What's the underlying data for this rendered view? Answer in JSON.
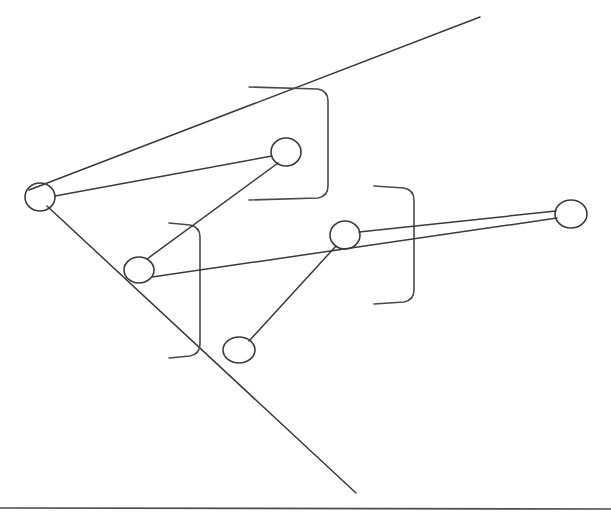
{
  "canvas": {
    "width": 611,
    "height": 517,
    "background": "#ffffff",
    "ink_color": "#3a3a3a"
  },
  "diagram": {
    "style": "pen line drawing",
    "nodes": [
      {
        "id": "n1",
        "label": "",
        "cx": 40,
        "cy": 197,
        "rx": 15,
        "ry": 14
      },
      {
        "id": "n2",
        "label": "",
        "cx": 139,
        "cy": 270,
        "rx": 15,
        "ry": 13
      },
      {
        "id": "n3",
        "label": "",
        "cx": 286,
        "cy": 152,
        "rx": 15,
        "ry": 14
      },
      {
        "id": "n4",
        "label": "",
        "cx": 239,
        "cy": 350,
        "rx": 16,
        "ry": 13
      },
      {
        "id": "n5",
        "label": "",
        "cx": 345,
        "cy": 235,
        "rx": 15,
        "ry": 14
      },
      {
        "id": "n6",
        "label": "",
        "cx": 571,
        "cy": 214,
        "rx": 16,
        "ry": 14
      }
    ],
    "edges": [
      {
        "id": "e1",
        "from": "n1",
        "to": "n3",
        "x1": 55,
        "y1": 196,
        "x2": 272,
        "y2": 156
      },
      {
        "id": "e2",
        "from": "n2",
        "to": "n3",
        "x1": 147,
        "y1": 259,
        "x2": 278,
        "y2": 163
      },
      {
        "id": "e3",
        "from": "n2",
        "to": "n6",
        "x1": 152,
        "y1": 277,
        "x2": 557,
        "y2": 218
      },
      {
        "id": "e4",
        "from": "n5",
        "to": "n6",
        "x1": 359,
        "y1": 232,
        "x2": 556,
        "y2": 211
      },
      {
        "id": "e5",
        "from": "n4",
        "to": "n5",
        "x1": 249,
        "y1": 341,
        "x2": 336,
        "y2": 246
      }
    ],
    "long_strokes": [
      {
        "id": "s1",
        "name": "upper-left-to-top-right-ray",
        "x1": 29,
        "y1": 190,
        "x2": 480,
        "y2": 17
      },
      {
        "id": "s2",
        "name": "upper-left-to-bottom-right-ray",
        "x1": 47,
        "y1": 206,
        "x2": 356,
        "y2": 493
      }
    ],
    "brackets": [
      {
        "id": "b1",
        "name": "bracket-top-middle",
        "top_y": 88,
        "bottom_y": 199,
        "arm_left_x": 249,
        "spine_x": 328,
        "orientation": "right"
      },
      {
        "id": "b2",
        "name": "bracket-lower-left",
        "top_y": 224,
        "bottom_y": 357,
        "arm_left_x": 169,
        "spine_x": 200,
        "orientation": "right"
      },
      {
        "id": "b3",
        "name": "bracket-right",
        "top_y": 187,
        "bottom_y": 303,
        "arm_left_x": 374,
        "spine_x": 414,
        "orientation": "right"
      }
    ],
    "baseline": {
      "id": "baseline",
      "name": "bottom-rule",
      "x1": 0,
      "y1": 508,
      "x2": 611,
      "y2": 509
    }
  }
}
